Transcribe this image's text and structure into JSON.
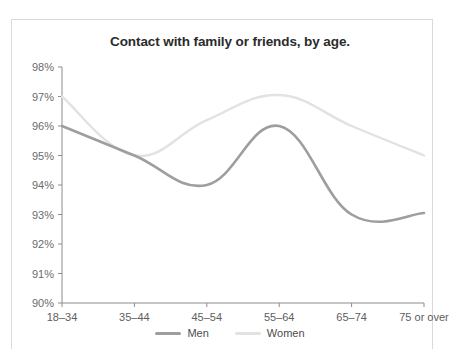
{
  "chart_data": {
    "type": "line",
    "title": "Contact with family or friends, by age.",
    "xlabel": "",
    "ylabel": "",
    "categories": [
      "18–34",
      "35–44",
      "45–54",
      "55–64",
      "65–74",
      "75 or over"
    ],
    "series": [
      {
        "name": "Men",
        "values": [
          96.0,
          95.0,
          94.0,
          96.0,
          93.0,
          93.05
        ],
        "color": "#9e9e9e"
      },
      {
        "name": "Women",
        "values": [
          97.0,
          95.0,
          96.2,
          97.05,
          96.0,
          95.0
        ],
        "color": "#e2e2e2"
      }
    ],
    "ylim": [
      90,
      98
    ],
    "ytick_labels": [
      "98%",
      "97%",
      "96%",
      "95%",
      "94%",
      "93%",
      "92%",
      "91%",
      "90%"
    ],
    "ytick_values": [
      98,
      97,
      96,
      95,
      94,
      93,
      92,
      91,
      90
    ],
    "grid": false,
    "legend_position": "bottom",
    "axis_color": "#8c8c8c",
    "title_color": "#2b2b2b",
    "frame_color": "#d9d9d9"
  },
  "legend": {
    "items": [
      {
        "label": "Men",
        "color": "#9e9e9e"
      },
      {
        "label": "Women",
        "color": "#e2e2e2"
      }
    ]
  }
}
